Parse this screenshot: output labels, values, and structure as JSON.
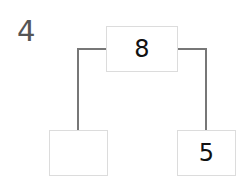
{
  "problem": {
    "number": "4"
  },
  "number_bond": {
    "whole": "8",
    "part_left": "",
    "part_right": "5"
  },
  "colors": {
    "text": "#111111",
    "number_label": "#555555",
    "box_border": "#dcdcdc",
    "connector": "#777777"
  }
}
